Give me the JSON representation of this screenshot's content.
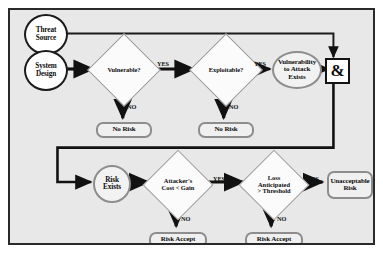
{
  "diagram": {
    "background_color": "#e8e8e8",
    "frame_color": "#2a2a2a",
    "nodes": {
      "threat_source": "Threat\nSource",
      "threat_source_line1": "Threat",
      "threat_source_line2": "Source",
      "system_design_line1": "System",
      "system_design_line2": "Design",
      "vulnerable": "Vulnerable?",
      "exploitable": "Exploitable?",
      "vuln_exists_line1": "Vulnerability",
      "vuln_exists_line2": "to Attack",
      "vuln_exists_line3": "Exists",
      "and_gate": "&",
      "no_risk_1": "No Risk",
      "no_risk_2": "No Risk",
      "risk_exists_line1": "Risk",
      "risk_exists_line2": "Exists",
      "attacker_cost_line1": "Attacker's",
      "attacker_cost_line2": "Cost < Gain",
      "loss_line1": "Loss",
      "loss_line2": "Anticipated",
      "loss_line3": "> Threshold",
      "unacceptable_line1": "Unacceptable",
      "unacceptable_line2": "Risk",
      "risk_accept_1": "Risk Accept",
      "risk_accept_2": "Risk Accept"
    },
    "edge_labels": {
      "yes_vulnerable": "YES",
      "no_vulnerable": "NO",
      "yes_exploitable": "YES",
      "no_exploitable": "NO",
      "yes_cost": "YES",
      "no_cost": "NO",
      "yes_loss": "YES",
      "no_loss": "NO"
    }
  }
}
